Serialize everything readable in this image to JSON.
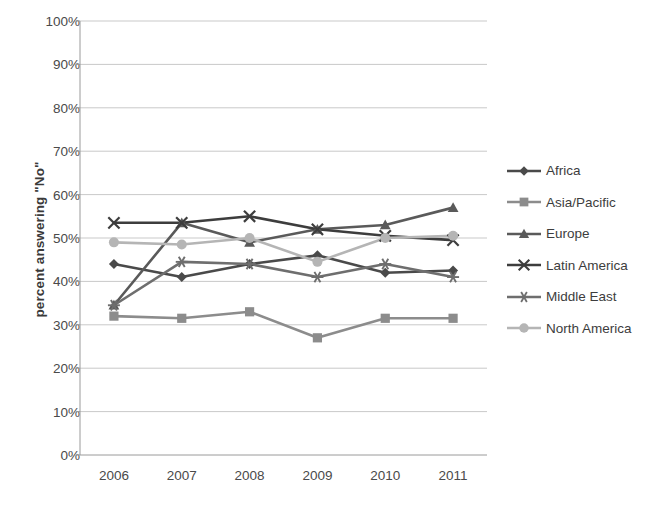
{
  "chart_data": {
    "type": "line",
    "title": "",
    "xlabel": "",
    "ylabel": "percent answering \"No\"",
    "categories": [
      "2006",
      "2007",
      "2008",
      "2009",
      "2010",
      "2011"
    ],
    "x": [
      2006,
      2007,
      2008,
      2009,
      2010,
      2011
    ],
    "ylim": [
      0,
      100
    ],
    "y_unit": "%",
    "yticks": [
      "0%",
      "10%",
      "20%",
      "30%",
      "40%",
      "50%",
      "60%",
      "70%",
      "80%",
      "90%",
      "100%"
    ],
    "ytick_values": [
      0,
      10,
      20,
      30,
      40,
      50,
      60,
      70,
      80,
      90,
      100
    ],
    "grid": true,
    "grid_axis": "y",
    "legend_position": "right",
    "series": [
      {
        "name": "Africa",
        "marker": "diamond",
        "color": "#4a4a4a",
        "values": [
          44.0,
          41.0,
          44.0,
          46.0,
          42.0,
          42.5
        ]
      },
      {
        "name": "Asia/Pacific",
        "marker": "square",
        "color": "#8c8c8c",
        "values": [
          32.0,
          31.5,
          33.0,
          27.0,
          31.5,
          31.5
        ]
      },
      {
        "name": "Europe",
        "marker": "triangle",
        "color": "#5a5a5a",
        "values": [
          34.5,
          53.5,
          49.0,
          52.0,
          53.0,
          57.0
        ]
      },
      {
        "name": "Latin America",
        "marker": "x",
        "color": "#3d3d3d",
        "values": [
          53.5,
          53.5,
          55.0,
          52.0,
          50.5,
          49.5
        ]
      },
      {
        "name": "Middle East",
        "marker": "asterisk",
        "color": "#6e6e6e",
        "values": [
          34.5,
          44.5,
          44.0,
          41.0,
          44.0,
          41.0
        ]
      },
      {
        "name": "North America",
        "marker": "circle",
        "color": "#b5b5b5",
        "values": [
          49.0,
          48.5,
          50.0,
          44.5,
          50.0,
          50.5
        ]
      }
    ]
  },
  "legend": {
    "items": [
      {
        "label": "Africa"
      },
      {
        "label": "Asia/Pacific"
      },
      {
        "label": "Europe"
      },
      {
        "label": "Latin America"
      },
      {
        "label": "Middle East"
      },
      {
        "label": "North America"
      }
    ]
  }
}
